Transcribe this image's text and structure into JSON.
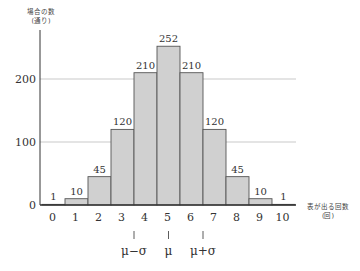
{
  "chart_data": {
    "type": "bar",
    "title": "",
    "xlabel": "表が出る回数 (回)",
    "ylabel": "場合の数 (通り)",
    "categories": [
      "0",
      "1",
      "2",
      "3",
      "4",
      "5",
      "6",
      "7",
      "8",
      "9",
      "10"
    ],
    "values": [
      1,
      10,
      45,
      120,
      210,
      252,
      210,
      120,
      45,
      10,
      1
    ],
    "yticks": [
      0,
      100,
      200
    ],
    "ylim": [
      0,
      270
    ],
    "grid": "horizontal at 100 and 200",
    "annotations": [
      {
        "x": 3.5,
        "label": "μ−σ"
      },
      {
        "x": 5,
        "label": "μ"
      },
      {
        "x": 6.5,
        "label": "μ+σ"
      }
    ],
    "colors": {
      "bar_fill": "#d0d0d0",
      "bar_stroke": "#555555",
      "grid": "#bbbbbb",
      "axis": "#333333"
    }
  },
  "labels": {
    "ylabel_line1": "場合の数",
    "ylabel_line2": "(通り)",
    "xlabel_line1": "表が出る回数",
    "xlabel_line2": "(回)"
  }
}
